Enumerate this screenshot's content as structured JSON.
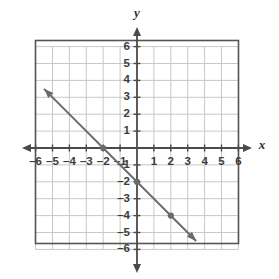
{
  "chart_data": {
    "type": "line",
    "title": "",
    "xlabel": "x",
    "ylabel": "y",
    "xlim": [
      -6,
      6
    ],
    "ylim": [
      -6,
      6
    ],
    "grid": true,
    "legend": null,
    "x_ticks": [
      -6,
      -5,
      -4,
      -3,
      -2,
      -1,
      1,
      2,
      3,
      4,
      5,
      6
    ],
    "y_ticks": [
      6,
      5,
      4,
      3,
      2,
      1,
      -1,
      -2,
      -3,
      -4,
      -5,
      -6
    ],
    "x_tick_labels": [
      "–6",
      "–5",
      "–4",
      "–3",
      "–2",
      "–1",
      "1",
      "2",
      "3",
      "4",
      "5",
      "6"
    ],
    "y_tick_labels": [
      "6",
      "5",
      "4",
      "3",
      "2",
      "1",
      "–1",
      "–2",
      "–3",
      "–4",
      "–5",
      "–6"
    ],
    "series": [
      {
        "name": "line",
        "type": "line",
        "equation": "y = -x - 2",
        "slope": -1,
        "intercept": -2,
        "color": "#6a6a6a",
        "arrow_start": [
          -5.5,
          3.5
        ],
        "arrow_end": [
          3.5,
          -5.5
        ],
        "points": [
          {
            "x": -2,
            "y": 0
          },
          {
            "x": 0,
            "y": -2
          },
          {
            "x": 2,
            "y": -4
          }
        ]
      }
    ],
    "colors": {
      "line": "#6a6a6a",
      "point": "#6a6a6a",
      "axis": "#4a4a4a",
      "grid": "#c8c8c8",
      "frame": "#555555",
      "label": "#3c3c3c",
      "background": "#ffffff"
    }
  },
  "axes": {
    "x_axis_label": "x",
    "y_axis_label": "y"
  }
}
